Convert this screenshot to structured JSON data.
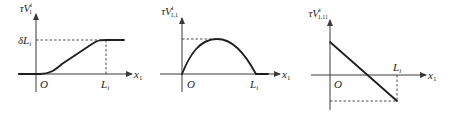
{
  "figure": {
    "panels": [
      {
        "id": "panel-1",
        "y_label": "τV",
        "y_label_sup": "i",
        "y_label_sub": "1",
        "x_label": "x",
        "x_label_sub": "1",
        "origin_label": "O",
        "x_tick_label": "L",
        "x_tick_sub": "i",
        "y_tick_label": "δL",
        "y_tick_sub": "i",
        "shape": "sigmoid rising from 0 to δL_i, flat after L_i"
      },
      {
        "id": "panel-2",
        "y_label": "τV",
        "y_label_sup": "i",
        "y_label_sub": "1,1",
        "x_label": "x",
        "x_label_sub": "1",
        "origin_label": "O",
        "x_tick_label": "L",
        "x_tick_sub": "i",
        "shape": "arch from 0 at O to 0 at L_i with dashed maximum"
      },
      {
        "id": "panel-3",
        "y_label": "τV",
        "y_label_sup": "i",
        "y_label_sub": "1,11",
        "x_label": "x",
        "x_label_sub": "1",
        "origin_label": "O",
        "x_tick_label": "L",
        "x_tick_sub": "i",
        "shape": "linear decreasing from positive at O to negative at L_i"
      }
    ],
    "colors": {
      "line": "#1e1e1e",
      "axis": "#3a3a3a",
      "background": "#ffffff"
    }
  }
}
